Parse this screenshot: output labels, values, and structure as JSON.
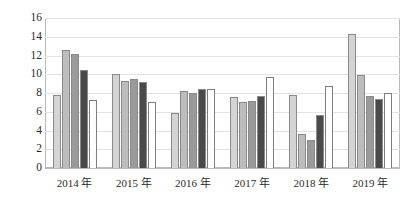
{
  "chart_data": {
    "type": "bar",
    "title": "",
    "subtitle": "",
    "xlabel": "",
    "ylabel": "",
    "categories": [
      "2014 年",
      "2015 年",
      "2016 年",
      "2017 年",
      "2018 年",
      "2019 年"
    ],
    "ylim": [
      0,
      16
    ],
    "yticks": [
      0,
      2,
      4,
      6,
      8,
      10,
      12,
      14,
      16
    ],
    "ytick_labels": [
      "0",
      "2",
      "4",
      "6",
      "8",
      "10",
      "12",
      "14",
      "16"
    ],
    "grid": true,
    "legend": "none",
    "series": [
      {
        "name": "Series 1",
        "color": "#d4d4d4",
        "values": [
          7.8,
          10.0,
          5.9,
          7.6,
          7.8,
          14.3
        ]
      },
      {
        "name": "Series 2",
        "color": "#bdbdbd",
        "values": [
          12.6,
          9.3,
          8.2,
          7.0,
          3.6,
          9.9
        ]
      },
      {
        "name": "Series 3",
        "color": "#9a9a9a",
        "values": [
          12.2,
          9.5,
          8.0,
          7.2,
          3.0,
          7.7
        ]
      },
      {
        "name": "Series 4",
        "color": "#4a4a4a",
        "values": [
          10.5,
          9.2,
          8.4,
          7.7,
          5.7,
          7.4
        ]
      },
      {
        "name": "Series 5",
        "color": "#ffffff",
        "values": [
          7.3,
          7.0,
          8.4,
          9.7,
          8.7,
          8.0
        ]
      }
    ]
  }
}
